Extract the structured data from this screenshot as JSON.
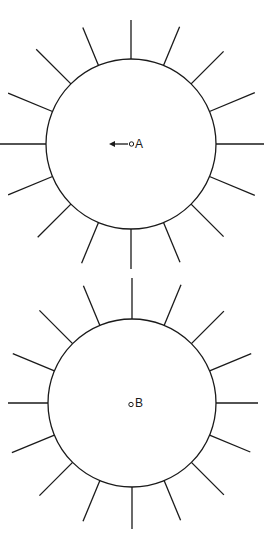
{
  "figures": [
    {
      "id": "A",
      "label": "A",
      "spike_count": 16,
      "has_arrow": true,
      "arrow_direction": "left"
    },
    {
      "id": "B",
      "label": "B",
      "spike_count": 16,
      "has_arrow": false
    }
  ]
}
